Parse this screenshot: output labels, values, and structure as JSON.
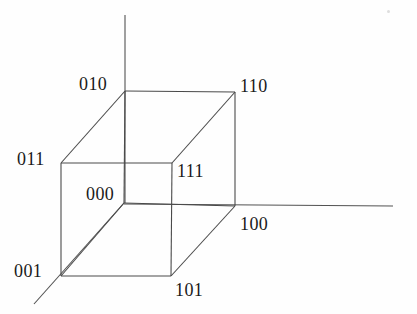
{
  "figure": {
    "background_color": "#fefefe",
    "line_color": "#4a4a4a",
    "text_color": "#1a1a1a",
    "line_width": 1.1
  },
  "axes": [
    {
      "name": "vertical-axis",
      "label": "",
      "x1": 125,
      "y1": 15,
      "x2": 125,
      "y2": 203
    },
    {
      "name": "horizontal-axis",
      "label": "",
      "x1": 124,
      "y1": 204,
      "x2": 393,
      "y2": 206
    },
    {
      "name": "depth-axis",
      "label": "",
      "x1": 124,
      "y1": 203,
      "x2": 34,
      "y2": 304
    }
  ],
  "vertices": [
    {
      "id": "v010",
      "code": "010",
      "x": 125,
      "y": 91,
      "label_x": 79,
      "label_y": 75
    },
    {
      "id": "v110",
      "code": "110",
      "x": 235,
      "y": 92,
      "label_x": 240,
      "label_y": 77
    },
    {
      "id": "v011",
      "code": "011",
      "x": 61,
      "y": 163,
      "label_x": 17,
      "label_y": 150
    },
    {
      "id": "v111",
      "code": "111",
      "x": 172,
      "y": 163,
      "label_x": 177,
      "label_y": 162
    },
    {
      "id": "v000",
      "code": "000",
      "x": 124,
      "y": 203,
      "label_x": 86,
      "label_y": 185
    },
    {
      "id": "v100",
      "code": "100",
      "x": 235,
      "y": 206,
      "label_x": 240,
      "label_y": 215
    },
    {
      "id": "v001",
      "code": "001",
      "x": 61,
      "y": 276,
      "label_x": 14,
      "label_y": 262
    },
    {
      "id": "v101",
      "code": "101",
      "x": 171,
      "y": 276,
      "label_x": 175,
      "label_y": 281
    }
  ],
  "edges": [
    {
      "name": "edge-010-110",
      "from": "010",
      "to": "110",
      "x1": 125,
      "y1": 91,
      "x2": 235,
      "y2": 92
    },
    {
      "name": "edge-010-011",
      "from": "010",
      "to": "011",
      "x1": 125,
      "y1": 91,
      "x2": 61,
      "y2": 163
    },
    {
      "name": "edge-010-000",
      "from": "010",
      "to": "000",
      "x1": 125,
      "y1": 91,
      "x2": 124,
      "y2": 203
    },
    {
      "name": "edge-110-111",
      "from": "110",
      "to": "111",
      "x1": 235,
      "y1": 92,
      "x2": 172,
      "y2": 163
    },
    {
      "name": "edge-110-100",
      "from": "110",
      "to": "100",
      "x1": 235,
      "y1": 92,
      "x2": 235,
      "y2": 206
    },
    {
      "name": "edge-011-111",
      "from": "011",
      "to": "111",
      "x1": 61,
      "y1": 163,
      "x2": 172,
      "y2": 163
    },
    {
      "name": "edge-011-001",
      "from": "011",
      "to": "001",
      "x1": 61,
      "y1": 163,
      "x2": 61,
      "y2": 276
    },
    {
      "name": "edge-111-101",
      "from": "111",
      "to": "101",
      "x1": 172,
      "y1": 163,
      "x2": 171,
      "y2": 276
    },
    {
      "name": "edge-000-100",
      "from": "000",
      "to": "100",
      "x1": 124,
      "y1": 203,
      "x2": 235,
      "y2": 206
    },
    {
      "name": "edge-000-001",
      "from": "000",
      "to": "001",
      "x1": 124,
      "y1": 203,
      "x2": 61,
      "y2": 276
    },
    {
      "name": "edge-001-101",
      "from": "001",
      "to": "101",
      "x1": 61,
      "y1": 276,
      "x2": 171,
      "y2": 276
    },
    {
      "name": "edge-101-100",
      "from": "101",
      "to": "100",
      "x1": 171,
      "y1": 276,
      "x2": 235,
      "y2": 206
    }
  ],
  "artifacts": [
    {
      "name": "scan-speck",
      "x": 387,
      "y": 10
    }
  ]
}
